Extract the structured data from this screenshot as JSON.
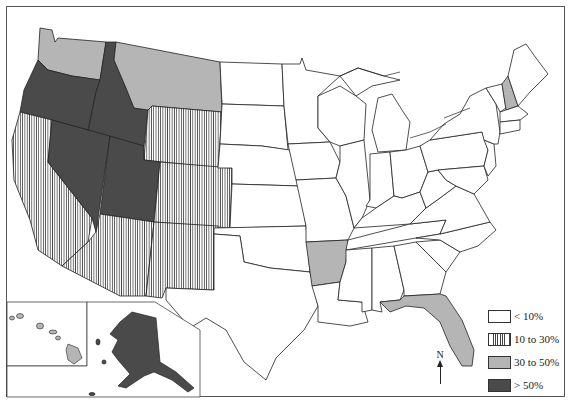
{
  "map": {
    "type": "choropleth",
    "region": "United States",
    "legend": {
      "items": [
        {
          "label": "< 10%",
          "pattern": "white",
          "color": "#ffffff"
        },
        {
          "label": "10 to 30%",
          "pattern": "vertical-hatch",
          "color": "#444444"
        },
        {
          "label": "30 to 50%",
          "pattern": "light-gray",
          "color": "#b5b5b5"
        },
        {
          "label": "> 50%",
          "pattern": "dark-gray",
          "color": "#4a4a4a"
        }
      ]
    },
    "north_arrow": {
      "label": "N"
    },
    "categories": {
      "gt50": [
        "Oregon",
        "Idaho",
        "Nevada",
        "Utah",
        "Alaska"
      ],
      "30to50": [
        "Washington",
        "Montana",
        "Arkansas",
        "Florida",
        "New Hampshire",
        "Hawaii"
      ],
      "10to30": [
        "California",
        "Wyoming",
        "Colorado",
        "Arizona",
        "New Mexico"
      ],
      "lt10": [
        "North Dakota",
        "South Dakota",
        "Nebraska",
        "Kansas",
        "Oklahoma",
        "Texas",
        "Minnesota",
        "Iowa",
        "Missouri",
        "Louisiana",
        "Wisconsin",
        "Illinois",
        "Michigan",
        "Indiana",
        "Ohio",
        "Kentucky",
        "Tennessee",
        "Mississippi",
        "Alabama",
        "Georgia",
        "South Carolina",
        "North Carolina",
        "Virginia",
        "West Virginia",
        "Maryland",
        "Delaware",
        "Pennsylvania",
        "New Jersey",
        "New York",
        "Connecticut",
        "Rhode Island",
        "Massachusetts",
        "Vermont",
        "Maine"
      ]
    },
    "insets": [
      "Hawaii",
      "Alaska"
    ]
  }
}
